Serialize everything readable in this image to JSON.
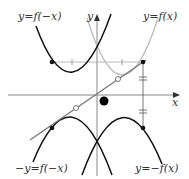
{
  "diagram": {
    "labels": {
      "f_neg_x": "y=f(−x)",
      "f_x": "y=f(x)",
      "neg_f_neg_x": "−y=f(−x)",
      "neg_f_x": "y=−f(x)",
      "x_axis": "x",
      "y_axis": "y"
    },
    "colors": {
      "dark_curve": "#111111",
      "light_curve": "#bbbbbb",
      "axis": "#888888",
      "line": "#777777"
    },
    "curves": [
      {
        "name": "f(-x)",
        "style": "dark",
        "vertex": [
          72,
          75
        ]
      },
      {
        "name": "f(x)",
        "style": "light",
        "vertex": [
          122,
          75
        ]
      },
      {
        "name": "-f(-x)",
        "style": "dark",
        "vertex": [
          72,
          115
        ]
      },
      {
        "name": "-f(x)",
        "style": "dark",
        "vertex": [
          122,
          115
        ]
      }
    ],
    "points": {
      "p_fx": [
        143,
        62
      ],
      "p_neg_fx": [
        143,
        128
      ],
      "p_f_neg_x": [
        52,
        62
      ],
      "p_neg_f_neg_x": [
        52,
        128
      ],
      "center_dot": [
        104,
        101
      ]
    }
  }
}
